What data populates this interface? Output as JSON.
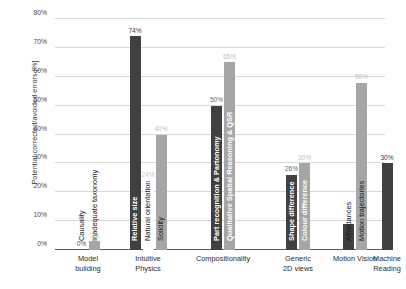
{
  "chart_data": {
    "type": "bar",
    "title": "",
    "xlabel": "",
    "ylabel": "Potential corrected/avoided errors [%]",
    "ylim": [
      0,
      80
    ],
    "grid": true,
    "legend": "none",
    "ytick_labels": [
      "0%",
      "10%",
      "20%",
      "30%",
      "40%",
      "50%",
      "60%",
      "70%",
      "80%"
    ],
    "ytick_values": [
      0,
      10,
      20,
      30,
      40,
      50,
      60,
      70,
      80
    ],
    "categories": [
      "Model building",
      "Intuitive Physics",
      "Compositionality",
      "Generic 2D views",
      "Motion Vision",
      "Machine Reading"
    ],
    "groups": [
      {
        "category": "Model building",
        "category_line1": "Model",
        "category_line2": "building",
        "bars": [
          {
            "name": "Causality",
            "value": 0,
            "label": "0%",
            "color": "#404040",
            "label_color": "#595959",
            "name_color": "#1a1a1a",
            "name_inside": false
          },
          {
            "name": "Inadequate taxonomy",
            "value": 3,
            "label": "3%",
            "color": "#a6a6a6",
            "label_color": "#bfbfbf",
            "name_color": "#1a1a1a",
            "name_inside": false
          }
        ]
      },
      {
        "category": "Intuitive Physics",
        "category_line1": "Intuitive",
        "category_line2": "Physics",
        "bars": [
          {
            "name": "Relative size",
            "value": 74,
            "label": "74%",
            "color": "#404040",
            "label_color": "#404040",
            "name_color": "#ffffff",
            "name_inside": true
          },
          {
            "name": "Natural orientation",
            "value": 24,
            "label": "24%",
            "color": "#ffffff",
            "label_color": "#c9c9c9",
            "name_color": "#1a1a1a",
            "name_inside": false
          },
          {
            "name": "Solidity",
            "value": 40,
            "label": "40%",
            "color": "#a6a6a6",
            "label_color": "#bfbfbf",
            "name_color": "#1a1a1a",
            "name_inside": false
          }
        ]
      },
      {
        "category": "Compositionality",
        "category_line1": "Compositionality",
        "category_line2": "",
        "bars": [
          {
            "name": "Part recognition & Partonomy",
            "value": 50,
            "label": "50%",
            "color": "#404040",
            "label_color": "#6b6b6b",
            "name_color": "#ffffff",
            "name_inside": true
          },
          {
            "name": "Qualitative Spatial Reasoning & QSR",
            "value": 65,
            "label": "65%",
            "color": "#a6a6a6",
            "label_color": "#bfbfbf",
            "name_color": "#ffffff",
            "name_inside": true
          }
        ]
      },
      {
        "category": "Generic 2D views",
        "category_line1": "Generic",
        "category_line2": "2D views",
        "bars": [
          {
            "name": "Shape difference",
            "value": 26,
            "label": "26%",
            "color": "#404040",
            "label_color": "#6b6b6b",
            "name_color": "#ffffff",
            "name_inside": true
          },
          {
            "name": "Colour difference",
            "value": 30,
            "label": "30%",
            "color": "#a6a6a6",
            "label_color": "#bfbfbf",
            "name_color": "#ffffff",
            "name_inside": true
          }
        ]
      },
      {
        "category": "Motion Vision",
        "category_line1": "Motion Vision",
        "category_line2": "",
        "bars": [
          {
            "name": "Affordances",
            "value": 9,
            "label": "9%",
            "color": "#404040",
            "label_color": "#ffffff",
            "name_color": "#1a1a1a",
            "name_inside": false
          },
          {
            "name": "Motion trajectories",
            "value": 58,
            "label": "58%",
            "color": "#a6a6a6",
            "label_color": "#bfbfbf",
            "name_color": "#1a1a1a",
            "name_inside": false
          }
        ]
      },
      {
        "category": "Machine Reading",
        "category_line1": "Machine",
        "category_line2": "Reading",
        "bars": [
          {
            "name": "",
            "value": 30,
            "label": "30%",
            "color": "#404040",
            "label_color": "#404040",
            "name_color": "#1a1a1a",
            "name_inside": false
          }
        ]
      }
    ]
  }
}
